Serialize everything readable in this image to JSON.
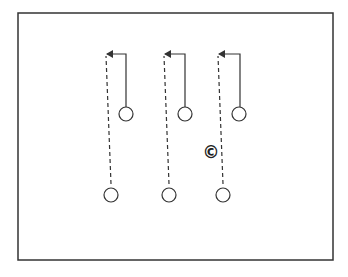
{
  "diagram": {
    "type": "play-diagram",
    "frame": {
      "x": 18,
      "y": 13,
      "width": 315,
      "height": 247,
      "stroke": "#333333"
    },
    "colors": {
      "line": "#333333",
      "player_fill": "#ffffff",
      "background": "#ffffff"
    },
    "coach": {
      "symbol": "©",
      "label": "coach",
      "x": 211,
      "y": 152
    },
    "players_front": [
      {
        "id": "front-1",
        "x": 126,
        "y": 114,
        "r": 7
      },
      {
        "id": "front-2",
        "x": 185,
        "y": 114,
        "r": 7
      },
      {
        "id": "front-3",
        "x": 239,
        "y": 114,
        "r": 7
      }
    ],
    "players_back": [
      {
        "id": "back-1",
        "x": 111,
        "y": 195,
        "r": 7
      },
      {
        "id": "back-2",
        "x": 169,
        "y": 195,
        "r": 7
      },
      {
        "id": "back-3",
        "x": 223,
        "y": 195,
        "r": 7
      }
    ],
    "solid_routes": [
      {
        "id": "run-1",
        "points": [
          [
            126,
            107
          ],
          [
            126,
            54
          ],
          [
            107,
            54
          ]
        ]
      },
      {
        "id": "run-2",
        "points": [
          [
            185,
            107
          ],
          [
            185,
            54
          ],
          [
            165,
            54
          ]
        ]
      },
      {
        "id": "run-3",
        "points": [
          [
            240,
            107
          ],
          [
            240,
            54
          ],
          [
            219,
            54
          ]
        ]
      }
    ],
    "dashed_routes": [
      {
        "id": "pass-1",
        "from": [
          111,
          184
        ],
        "to": [
          106,
          56
        ]
      },
      {
        "id": "pass-2",
        "from": [
          169,
          184
        ],
        "to": [
          164,
          56
        ]
      },
      {
        "id": "pass-3",
        "from": [
          223,
          184
        ],
        "to": [
          218,
          56
        ]
      }
    ],
    "legend": {
      "solid": "player movement",
      "dashed": "pass",
      "circle": "player",
      "c_symbol": "coach"
    }
  }
}
